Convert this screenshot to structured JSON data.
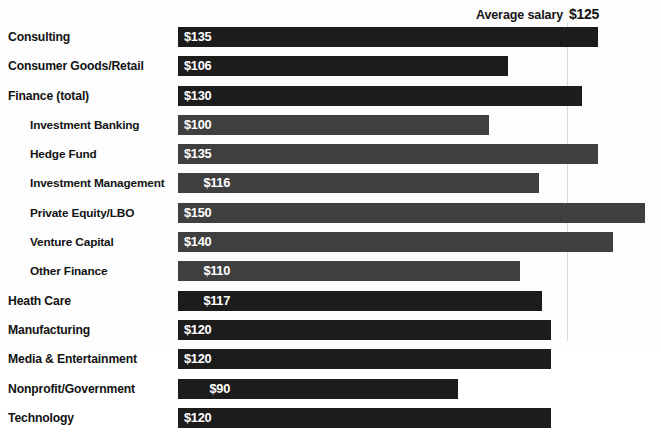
{
  "header": {
    "average_label": "Average salary",
    "average_value": "$125"
  },
  "colors": {
    "bar_primary": "#1c1c1c",
    "bar_secondary": "#3f3f3f",
    "background": "#fdfdfd",
    "reference_line": "#d8d8d8",
    "label_text": "#121212",
    "value_text": "#ffffff"
  },
  "chart_data": {
    "type": "bar",
    "orientation": "horizontal",
    "title": "",
    "subtitle": "",
    "xlabel": "",
    "ylabel": "",
    "xlim": [
      0,
      155
    ],
    "grid": false,
    "legend": null,
    "value_prefix": "$",
    "value_unit": "thousands USD",
    "average_line": 125,
    "categories": [
      "Consulting",
      "Consumer Goods/Retail",
      "Finance (total)",
      "Investment Banking",
      "Hedge Fund",
      "Investment Management",
      "Private Equity/LBO",
      "Venture Capital",
      "Other Finance",
      "Heath Care",
      "Manufacturing",
      "Media & Entertainment",
      "Nonprofit/Government",
      "Technology"
    ],
    "values": [
      135,
      106,
      130,
      100,
      135,
      116,
      150,
      140,
      110,
      117,
      120,
      120,
      90,
      120
    ],
    "value_labels": [
      "$135",
      "$106",
      "$130",
      "$100",
      "$135",
      "$116",
      "$150",
      "$140",
      "$110",
      "$117",
      "$120",
      "$120",
      "$90",
      "$120"
    ]
  },
  "rows": [
    {
      "label": "Consulting",
      "value": "$135",
      "num": 135,
      "indent": false,
      "narrow": false
    },
    {
      "label": "Consumer Goods/Retail",
      "value": "$106",
      "num": 106,
      "indent": false,
      "narrow": false
    },
    {
      "label": "Finance (total)",
      "value": "$130",
      "num": 130,
      "indent": false,
      "narrow": false
    },
    {
      "label": "Investment Banking",
      "value": "$100",
      "num": 100,
      "indent": true,
      "narrow": false
    },
    {
      "label": "Hedge Fund",
      "value": "$135",
      "num": 135,
      "indent": true,
      "narrow": false
    },
    {
      "label": "Investment Management",
      "value": "$116",
      "num": 116,
      "indent": true,
      "narrow": true
    },
    {
      "label": "Private Equity/LBO",
      "value": "$150",
      "num": 150,
      "indent": true,
      "narrow": false
    },
    {
      "label": "Venture Capital",
      "value": "$140",
      "num": 140,
      "indent": true,
      "narrow": false
    },
    {
      "label": "Other Finance",
      "value": "$110",
      "num": 110,
      "indent": true,
      "narrow": true
    },
    {
      "label": "Heath Care",
      "value": "$117",
      "num": 117,
      "indent": false,
      "narrow": true
    },
    {
      "label": "Manufacturing",
      "value": "$120",
      "num": 120,
      "indent": false,
      "narrow": false
    },
    {
      "label": "Media & Entertainment",
      "value": "$120",
      "num": 120,
      "indent": false,
      "narrow": false
    },
    {
      "label": "Nonprofit/Government",
      "value": "$90",
      "num": 90,
      "indent": false,
      "narrow": true
    },
    {
      "label": "Technology",
      "value": "$120",
      "num": 120,
      "indent": false,
      "narrow": false
    }
  ],
  "layout": {
    "bar_origin_x": 178,
    "px_per_dollar": 3.11
  }
}
